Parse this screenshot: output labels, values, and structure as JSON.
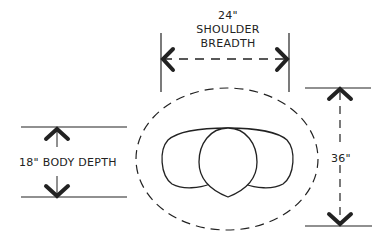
{
  "diagram": {
    "shoulder_breadth": {
      "value": "24\"",
      "line1": "SHOULDER",
      "line2": "BREADTH"
    },
    "body_depth": {
      "label": "18\" BODY DEPTH"
    },
    "zone_depth": {
      "value": "36\""
    }
  },
  "colors": {
    "stroke": "#222222",
    "background": "#ffffff"
  }
}
